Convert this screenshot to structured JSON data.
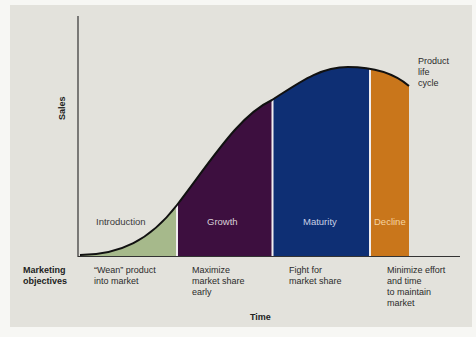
{
  "diagram": {
    "y_axis_label": "Sales",
    "x_axis_label": "Time",
    "curve_label": [
      "Product",
      "life",
      "cycle"
    ],
    "stages": [
      {
        "name": "Introduction",
        "color": "#a6b98b",
        "label_color": "#3a3a3a",
        "objective": [
          "“Wean” product",
          "into market"
        ]
      },
      {
        "name": "Growth",
        "color": "#3d0f3f",
        "label_color": "#d8d0d8",
        "objective": [
          "Maximize",
          "market share",
          "early"
        ]
      },
      {
        "name": "Maturity",
        "color": "#0e2f74",
        "label_color": "#c8d0e6",
        "objective": [
          "Fight for",
          "market share"
        ]
      },
      {
        "name": "Decline",
        "color": "#c9761b",
        "label_color": "#f6d4a0",
        "objective": [
          "Minimize effort",
          "and time",
          "to maintain",
          "market"
        ]
      }
    ],
    "objectives_row_label": [
      "Marketing",
      "objectives"
    ],
    "background_color": "#e3e2dc"
  }
}
